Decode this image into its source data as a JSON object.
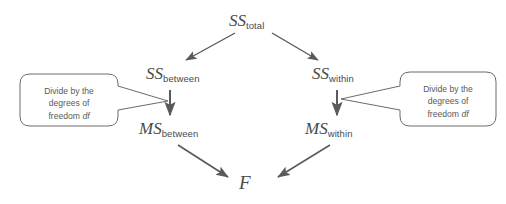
{
  "diagram": {
    "colors": {
      "stroke": "#5a5a5a",
      "text": "#4a4a4a",
      "callout_text": "#5a5a5a",
      "background": "#ffffff"
    },
    "nodes": [
      {
        "id": "ss-total",
        "base": "SS",
        "sub": "total",
        "x": 229,
        "y": 12
      },
      {
        "id": "ss-between",
        "base": "SS",
        "sub": "between",
        "x": 146,
        "y": 65
      },
      {
        "id": "ss-within",
        "base": "SS",
        "sub": "within",
        "x": 312,
        "y": 65
      },
      {
        "id": "ms-between",
        "base": "MS",
        "sub": "between",
        "x": 139,
        "y": 120
      },
      {
        "id": "ms-within",
        "base": "MS",
        "sub": "within",
        "x": 305,
        "y": 120
      },
      {
        "id": "f-statistic",
        "base": "F",
        "sub": "",
        "x": 239,
        "y": 173
      }
    ],
    "callouts": [
      {
        "id": "callout-left",
        "line1": "Divide by the",
        "line2": "degrees of",
        "line3_prefix": "freedom ",
        "line3_italic": "df"
      },
      {
        "id": "callout-right",
        "line1": "Divide by the",
        "line2": "degrees of",
        "line3_prefix": "freedom ",
        "line3_italic": "df"
      }
    ],
    "edges": [
      {
        "id": "edge-sstotal-to-ssbetween",
        "from": "ss-total",
        "to": "ss-between"
      },
      {
        "id": "edge-sstotal-to-sswithin",
        "from": "ss-total",
        "to": "ss-within"
      },
      {
        "id": "edge-ssbetween-to-msbetween",
        "from": "ss-between",
        "to": "ms-between"
      },
      {
        "id": "edge-sswithin-to-mswithin",
        "from": "ss-within",
        "to": "ms-within"
      },
      {
        "id": "edge-msbetween-to-f",
        "from": "ms-between",
        "to": "f-statistic"
      },
      {
        "id": "edge-mswithin-to-f",
        "from": "ms-within",
        "to": "f-statistic"
      }
    ]
  }
}
